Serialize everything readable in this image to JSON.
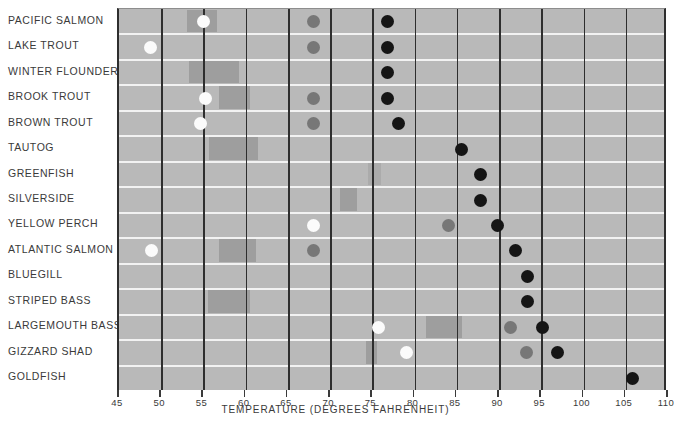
{
  "chart_data": {
    "type": "bar",
    "title": "",
    "xlabel": "TEMPERATURE (DEGREES FAHRENHEIT)",
    "ylabel": "",
    "xlim": [
      45,
      110
    ],
    "xticks": [
      45,
      50,
      55,
      60,
      65,
      70,
      75,
      80,
      85,
      90,
      95,
      100,
      105,
      110
    ],
    "grid": "vertical",
    "legend": "none",
    "marker_types": {
      "white": "spawning temperature",
      "gray": "growth / preferred temperature",
      "black": "upper lethal temperature"
    },
    "band_label": "preferred temperature range",
    "categories": [
      "PACIFIC SALMON",
      "LAKE TROUT",
      "WINTER FLOUNDER",
      "BROOK TROUT",
      "BROWN TROUT",
      "TAUTOG",
      "GREENFISH",
      "SILVERSIDE",
      "YELLOW PERCH",
      "ATLANTIC SALMON",
      "BLUEGILL",
      "STRIPED BASS",
      "LARGEMOUTH BASS",
      "GIZZARD SHAD",
      "GOLDFISH"
    ],
    "rows": [
      {
        "name": "PACIFIC SALMON",
        "band": [
          53.0,
          56.6
        ],
        "band_soft": false,
        "white": 55.0,
        "gray": 68.0,
        "black": 76.8
      },
      {
        "name": "LAKE TROUT",
        "band": null,
        "band_soft": false,
        "white": 48.7,
        "gray": 68.0,
        "black": 76.8
      },
      {
        "name": "WINTER FLOUNDER",
        "band": [
          53.3,
          59.2
        ],
        "band_soft": false,
        "white": null,
        "gray": null,
        "black": 76.8
      },
      {
        "name": "BROOK TROUT",
        "band": [
          56.8,
          60.5
        ],
        "band_soft": false,
        "white": 55.3,
        "gray": 68.0,
        "black": 76.8
      },
      {
        "name": "BROWN TROUT",
        "band": null,
        "band_soft": true,
        "white": 54.6,
        "gray": 68.0,
        "black": 78.1
      },
      {
        "name": "TAUTOG",
        "band": [
          55.6,
          61.5
        ],
        "band_soft": false,
        "white": null,
        "gray": null,
        "black": 85.6
      },
      {
        "name": "GREENFISH",
        "band": [
          74.5,
          76.0
        ],
        "band_soft": true,
        "white": null,
        "gray": null,
        "black": 87.8
      },
      {
        "name": "SILVERSIDE",
        "band": [
          71.2,
          73.2
        ],
        "band_soft": false,
        "white": null,
        "gray": null,
        "black": 87.8
      },
      {
        "name": "YELLOW PERCH",
        "band": null,
        "band_soft": false,
        "white": 68.0,
        "gray": 84.0,
        "black": 89.8
      },
      {
        "name": "ATLANTIC SALMON",
        "band": [
          56.8,
          61.2
        ],
        "band_soft": false,
        "white": 48.8,
        "gray": 68.0,
        "black": 92.0
      },
      {
        "name": "BLUEGILL",
        "band": null,
        "band_soft": false,
        "white": null,
        "gray": null,
        "black": 93.4
      },
      {
        "name": "STRIPED BASS",
        "band": [
          55.5,
          60.5
        ],
        "band_soft": false,
        "white": null,
        "gray": null,
        "black": 93.4
      },
      {
        "name": "LARGEMOUTH BASS",
        "band": [
          81.4,
          85.6
        ],
        "band_soft": false,
        "white": 75.7,
        "gray": 91.4,
        "black": 95.2
      },
      {
        "name": "GIZZARD SHAD",
        "band": [
          74.2,
          75.6
        ],
        "band_soft": false,
        "white": 79.0,
        "gray": 93.3,
        "black": 96.9
      },
      {
        "name": "GOLDFISH",
        "band": null,
        "band_soft": false,
        "white": null,
        "gray": null,
        "black": 105.8
      }
    ]
  },
  "axis": {
    "title": "TEMPERATURE (DEGREES FAHRENHEIT)",
    "tick_labels": [
      "45",
      "50",
      "55",
      "60",
      "65",
      "70",
      "75",
      "80",
      "85",
      "90",
      "95",
      "100",
      "105",
      "110"
    ]
  },
  "colors": {
    "plot_background": "#b9b9b9",
    "band": "#9e9e9e",
    "gridline": "#2e2e2e",
    "row_separator": "#f2f2f2",
    "white_marker": "#fbfbfb",
    "gray_marker": "#777777",
    "black_marker": "#151515",
    "text": "#3a3a3a"
  }
}
